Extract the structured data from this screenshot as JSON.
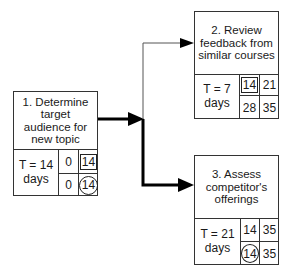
{
  "nodes": [
    {
      "id": "1",
      "title": "1. Determine target audience for new topic",
      "duration_line1": "T = 14",
      "duration_line2": "days",
      "es": "0",
      "ef": "14",
      "ls": "0",
      "lf": "14",
      "ef_marked": "boxed",
      "lf_marked": "circled"
    },
    {
      "id": "2",
      "title": "2. Review feedback from similar courses",
      "duration_line1": "T = 7",
      "duration_line2": "days",
      "es": "14",
      "ef": "21",
      "ls": "28",
      "lf": "35",
      "es_marked": "boxed"
    },
    {
      "id": "3",
      "title": "3. Assess competitor's offerings",
      "duration_line1": "T = 21",
      "duration_line2": "days",
      "es": "14",
      "ef": "35",
      "ls": "14",
      "lf": "35",
      "ls_marked": "circled"
    }
  ],
  "edges": [
    {
      "from": "1",
      "to": "2",
      "critical": false
    },
    {
      "from": "1",
      "to": "3",
      "critical": true
    }
  ],
  "colors": {
    "line": "#333333",
    "critical": "#000000"
  }
}
